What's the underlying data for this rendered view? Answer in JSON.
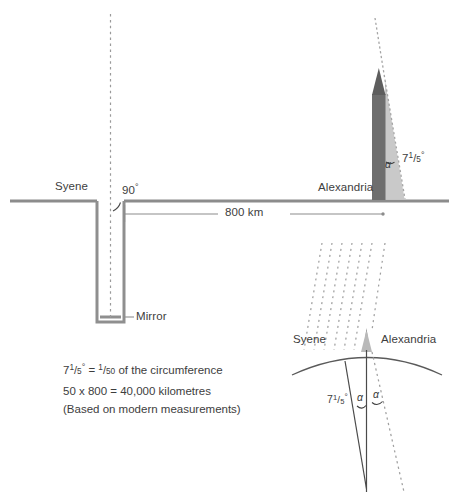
{
  "diagram": {
    "colors": {
      "ground_line": "#8c8c8c",
      "well_wall": "#8f8f8f",
      "obelisk_body": "#6e6e6e",
      "obelisk_shadow": "#c6c6c6",
      "text": "#3d3d3d",
      "ray_dotted": "#9a9a9a",
      "earth_arc": "#5a5a5a",
      "radius_line": "#4a4a4a"
    }
  },
  "upper": {
    "syene_label": "Syene",
    "alexandria_label": "Alexandria",
    "right_angle_label": "90",
    "right_angle_degree": "°",
    "mirror_label": "Mirror",
    "distance_label": "800 km",
    "shadow_angle": {
      "alpha": "α",
      "value_int": "7",
      "num": "1",
      "den": "5",
      "degree": "°"
    }
  },
  "lower": {
    "syene_label": "Syene",
    "alexandria_label": "Alexandria",
    "angle_value": {
      "int": "7",
      "num": "1",
      "den": "5",
      "degree": "°"
    },
    "alpha_left": "α",
    "alpha_right": "α"
  },
  "notes": {
    "line1": {
      "int": "7",
      "num": "1",
      "den": "5",
      "degree": "°",
      "equals": " = ",
      "frac_num": "1",
      "frac_den": "50",
      "tail": " of the circumference"
    },
    "line2": "50 x 800 = 40,000 kilometres",
    "line3": "(Based on modern measurements)"
  }
}
